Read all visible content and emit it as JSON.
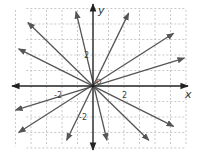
{
  "diagram": {
    "axes": {
      "x_label": "x",
      "y_label": "y",
      "tick_labels": {
        "x_pos": "2",
        "x_neg": "-2",
        "y_pos": "2",
        "y_neg": "-2"
      },
      "origin_label": "O"
    },
    "grid": {
      "x_range": [
        -5,
        6
      ],
      "y_range": [
        -4,
        5
      ],
      "style": "dashed"
    },
    "colors": {
      "axis": "#222222",
      "line": "#555555",
      "grid": "#bbbbbb"
    },
    "lines": [
      {
        "name": "slope-neg-1",
        "end1": [
          -4.2,
          4.1
        ],
        "end2": [
          3.6,
          -3.5
        ]
      },
      {
        "name": "slope-neg-half",
        "end1": [
          -4.8,
          2.4
        ],
        "end2": [
          5.2,
          -2.6
        ]
      },
      {
        "name": "slope-neg-4",
        "end1": [
          -1.1,
          4.8
        ],
        "end2": [
          0.9,
          -3.5
        ]
      },
      {
        "name": "slope-2",
        "end1": [
          2.3,
          4.7
        ],
        "end2": [
          -1.7,
          -3.5
        ]
      },
      {
        "name": "slope-two-thirds",
        "end1": [
          5.2,
          3.4
        ],
        "end2": [
          -4.8,
          -3.0
        ]
      },
      {
        "name": "slope-one-third",
        "end1": [
          5.9,
          1.8
        ],
        "end2": [
          -5.0,
          -1.55
        ]
      }
    ]
  }
}
